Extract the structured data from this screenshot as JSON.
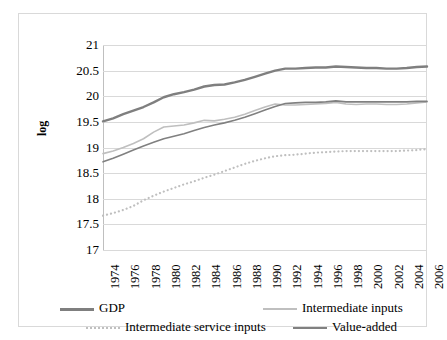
{
  "axis": {
    "y_title": "log",
    "y_ticks": [
      "21",
      "20.5",
      "20",
      "19.5",
      "19",
      "18.5",
      "18",
      "17.5",
      "17"
    ],
    "x_ticks": [
      "1974",
      "1976",
      "1978",
      "1980",
      "1982",
      "1984",
      "1986",
      "1988",
      "1990",
      "1992",
      "1994",
      "1996",
      "1998",
      "2000",
      "2002",
      "2004",
      "2006"
    ]
  },
  "legend": {
    "items": [
      {
        "label": "GDP",
        "style": "solid-thick",
        "color": "#7f7f7f"
      },
      {
        "label": "Intermediate inputs",
        "style": "solid",
        "color": "#bfbfbf"
      },
      {
        "label": "Intermediate service inputs",
        "style": "dotted",
        "color": "#bfbfbf"
      },
      {
        "label": "Value-added",
        "style": "solid",
        "color": "#808080"
      }
    ]
  },
  "chart_data": {
    "type": "line",
    "title": "",
    "xlabel": "",
    "ylabel": "log",
    "xlim": [
      1974,
      2006
    ],
    "ylim": [
      17,
      21
    ],
    "y_tick_step": 0.5,
    "grid": true,
    "legend_position": "bottom",
    "x": [
      1974,
      1975,
      1976,
      1977,
      1978,
      1979,
      1980,
      1981,
      1982,
      1983,
      1984,
      1985,
      1986,
      1987,
      1988,
      1989,
      1990,
      1991,
      1992,
      1993,
      1994,
      1995,
      1996,
      1997,
      1998,
      1999,
      2000,
      2001,
      2002,
      2003,
      2004,
      2005,
      2006
    ],
    "series": [
      {
        "name": "GDP",
        "color": "#7f7f7f",
        "style": "solid-thick",
        "values": [
          19.51,
          19.57,
          19.65,
          19.72,
          19.79,
          19.88,
          19.98,
          20.04,
          20.08,
          20.13,
          20.19,
          20.22,
          20.23,
          20.27,
          20.32,
          20.38,
          20.44,
          20.5,
          20.54,
          20.54,
          20.55,
          20.56,
          20.56,
          20.58,
          20.57,
          20.56,
          20.55,
          20.55,
          20.54,
          20.54,
          20.55,
          20.57,
          20.58
        ]
      },
      {
        "name": "Intermediate inputs",
        "color": "#bfbfbf",
        "style": "solid",
        "values": [
          18.88,
          18.93,
          19.0,
          19.08,
          19.17,
          19.3,
          19.4,
          19.42,
          19.44,
          19.48,
          19.53,
          19.52,
          19.55,
          19.59,
          19.65,
          19.72,
          19.79,
          19.85,
          19.83,
          19.83,
          19.84,
          19.85,
          19.86,
          19.88,
          19.85,
          19.84,
          19.85,
          19.85,
          19.84,
          19.84,
          19.85,
          19.87,
          19.89
        ]
      },
      {
        "name": "Intermediate service inputs",
        "color": "#bfbfbf",
        "style": "dotted",
        "values": [
          17.67,
          17.72,
          17.78,
          17.86,
          17.97,
          18.06,
          18.14,
          18.21,
          18.28,
          18.34,
          18.41,
          18.47,
          18.54,
          18.61,
          18.68,
          18.74,
          18.79,
          18.83,
          18.85,
          18.86,
          18.88,
          18.9,
          18.91,
          18.92,
          18.93,
          18.93,
          18.93,
          18.93,
          18.93,
          18.93,
          18.94,
          18.95,
          18.97
        ]
      },
      {
        "name": "Value-added",
        "color": "#808080",
        "style": "solid",
        "values": [
          18.72,
          18.79,
          18.87,
          18.95,
          19.03,
          19.1,
          19.17,
          19.22,
          19.27,
          19.33,
          19.39,
          19.44,
          19.48,
          19.53,
          19.59,
          19.66,
          19.73,
          19.8,
          19.86,
          19.87,
          19.88,
          19.88,
          19.89,
          19.91,
          19.89,
          19.89,
          19.89,
          19.89,
          19.89,
          19.89,
          19.89,
          19.9,
          19.9
        ]
      }
    ]
  }
}
